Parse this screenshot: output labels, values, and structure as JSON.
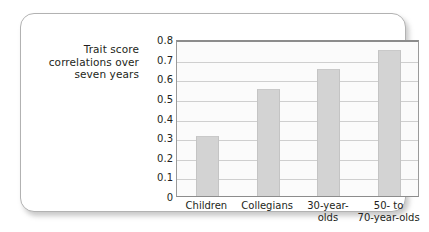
{
  "figure": {
    "y_axis_caption": "Trait score correlations over seven years"
  },
  "chart_data": {
    "type": "bar",
    "title": "",
    "subtitle": "",
    "xlabel": "",
    "ylabel": "Trait score correlations over seven years",
    "categories": [
      "Children",
      "Collegians",
      "30-year-olds",
      "50- to 70-year-olds"
    ],
    "category_label_lines": [
      "Children",
      "Collegians",
      "30-year-\nolds",
      "50-  to\n70-year-olds"
    ],
    "values": [
      0.305,
      0.545,
      0.645,
      0.745
    ],
    "ylim": [
      0,
      0.8
    ],
    "ytick_labels": [
      "0.8",
      "0.7",
      "0.6",
      "0.5",
      "0.4",
      "0.3",
      "0.2",
      "0.1",
      "0"
    ],
    "ytick_values": [
      0.8,
      0.7,
      0.6,
      0.5,
      0.4,
      0.3,
      0.2,
      0.1,
      0
    ],
    "grid": true,
    "legend": "none",
    "bar_color": "#d3d3d3",
    "gridline_color": "#cfcfcf",
    "plot_background": "#fbfbfb",
    "text_color": "#231f20"
  }
}
